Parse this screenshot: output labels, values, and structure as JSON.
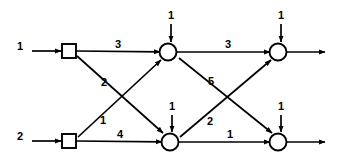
{
  "figure": {
    "width": 341,
    "height": 160,
    "background_color": "#ffffff",
    "stroke_color": "#000000"
  },
  "nodes": [
    {
      "id": "s1",
      "kind": "square",
      "label": "",
      "x": 69,
      "y": 51
    },
    {
      "id": "s2",
      "kind": "square",
      "label": "",
      "x": 69,
      "y": 141
    },
    {
      "id": "c1",
      "kind": "circle",
      "label": "",
      "x": 168,
      "y": 52
    },
    {
      "id": "c2",
      "kind": "circle",
      "label": "",
      "x": 170,
      "y": 142
    },
    {
      "id": "c3",
      "kind": "circle",
      "label": "",
      "x": 278,
      "y": 52
    },
    {
      "id": "c4",
      "kind": "circle",
      "label": "",
      "x": 278,
      "y": 142
    }
  ],
  "edges": [
    {
      "id": "e-in-top",
      "label": "1",
      "from": "external",
      "to": "s1",
      "label_x": 20,
      "label_y": 47
    },
    {
      "id": "e-in-bottom",
      "label": "2",
      "from": "external",
      "to": "s2",
      "label_x": 20,
      "label_y": 137
    },
    {
      "id": "e-s1-c1",
      "label": "3",
      "from": "s1",
      "to": "c1",
      "label_x": 118,
      "label_y": 46
    },
    {
      "id": "e-c1-c3",
      "label": "3",
      "from": "c1",
      "to": "c3",
      "label_x": 228,
      "label_y": 46
    },
    {
      "id": "e-s2-c2",
      "label": "4",
      "from": "s2",
      "to": "c2",
      "label_x": 120,
      "label_y": 136
    },
    {
      "id": "e-c2-c4",
      "label": "1",
      "from": "c2",
      "to": "c4",
      "label_x": 230,
      "label_y": 136
    },
    {
      "id": "e-s1-c2",
      "label": "2",
      "from": "s1",
      "to": "c2",
      "label_x": 104,
      "label_y": 83
    },
    {
      "id": "e-s2-c1",
      "label": "1",
      "from": "s2",
      "to": "c1",
      "label_x": 103,
      "label_y": 121
    },
    {
      "id": "e-c1-c4",
      "label": "5",
      "from": "c1",
      "to": "c4",
      "label_x": 211,
      "label_y": 82
    },
    {
      "id": "e-c2-c3",
      "label": "2",
      "from": "c2",
      "to": "c3",
      "label_x": 210,
      "label_y": 122
    },
    {
      "id": "e-src-c1",
      "label": "1",
      "from": "source",
      "to": "c1",
      "label_x": 171,
      "label_y": 16
    },
    {
      "id": "e-src-c3",
      "label": "1",
      "from": "source",
      "to": "c3",
      "label_x": 281,
      "label_y": 16
    },
    {
      "id": "e-src-c2",
      "label": "1",
      "from": "source",
      "to": "c2",
      "label_x": 172,
      "label_y": 107
    },
    {
      "id": "e-src-c4",
      "label": "1",
      "from": "source",
      "to": "c4",
      "label_x": 281,
      "label_y": 107
    },
    {
      "id": "e-out-top",
      "label": "",
      "from": "c3",
      "to": "external",
      "label_x": 0,
      "label_y": 0
    },
    {
      "id": "e-out-bottom",
      "label": "",
      "from": "c4",
      "to": "external",
      "label_x": 0,
      "label_y": 0
    }
  ]
}
